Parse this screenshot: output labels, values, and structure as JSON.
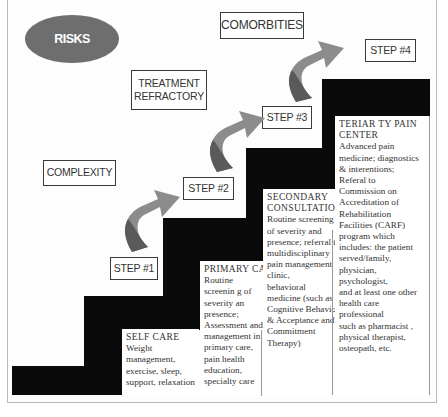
{
  "diagram": {
    "type": "staircase",
    "badge": {
      "label": "RISKS",
      "color": "#6e6e6e"
    },
    "factors": [
      {
        "id": "complexity",
        "label": "COMPLEXITY"
      },
      {
        "id": "treatment_refractory",
        "label": "TREATMENT REFRACTORY",
        "line1": "TREATMENT",
        "line2": "REFRACTORY"
      },
      {
        "id": "comorbities",
        "label": "COMORBITIES"
      }
    ],
    "steps": [
      {
        "label": "STEP #1"
      },
      {
        "label": "STEP #2"
      },
      {
        "label": "STEP #3"
      },
      {
        "label": "STEP #4"
      }
    ],
    "levels": [
      {
        "title": "SELF CARE",
        "lines": [
          "Weight management,",
          "exercise, sleep,",
          "support, relaxation"
        ]
      },
      {
        "title": "PRIMARY CARE",
        "lines": [
          "Routine",
          "screenin g of",
          "severity an",
          "presence;",
          "Assessment and",
          "management in",
          "primary care,",
          "pain health",
          "education,",
          "specialty care"
        ]
      },
      {
        "title_line1": "SECONDARY",
        "title_line2": "CONSULTATION",
        "lines": [
          "Routine screening",
          "of severity and",
          "presence; referral to",
          "multidisciplinary",
          "pain management",
          "clinic, behavioral",
          "medicine (such as",
          "Cognitive Behavioral",
          "& Acceptance and",
          "Commitment",
          "Therapy)"
        ]
      },
      {
        "title_line1": "TERIAR TY PAIN",
        "title_line2": "CENTER",
        "lines": [
          "Advanced pain",
          "medicine; diagnostics",
          "& interentions;",
          "Referal to",
          "Commission on",
          "Accreditation of",
          "Rehabilitation",
          "Facilities (CARF)",
          "program which",
          "includes: the patient",
          "served/family,",
          "physician,",
          "psychologist,",
          "and at least one other",
          "health care",
          "professional",
          "such as pharmacist ,",
          "physical therapist,",
          "osteopath, etc."
        ]
      }
    ],
    "colors": {
      "stairs": "#0a0a0a",
      "arrow_light": "#8c8c8c",
      "arrow_dark": "#5a5a5a",
      "label_border": "#3a3a3a"
    }
  }
}
